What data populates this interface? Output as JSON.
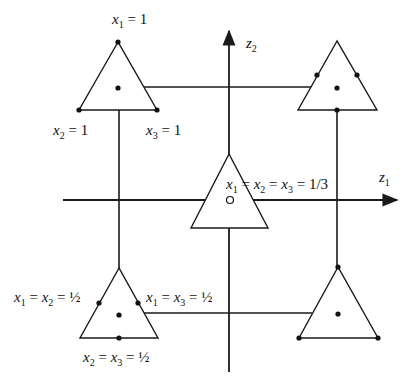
{
  "diagram": {
    "type": "simplex-embedding",
    "axes": {
      "horizontal": {
        "label": "z",
        "subscript": "1"
      },
      "vertical": {
        "label": "z",
        "subscript": "2"
      }
    },
    "triangles": [
      {
        "id": "top-left",
        "points": [
          "vertex top",
          "vertex bottom-left",
          "vertex bottom-right",
          "centroid"
        ],
        "labels": {
          "top": {
            "var": "x",
            "sub": "1",
            "rest": " = 1"
          },
          "bottom_left": {
            "var": "x",
            "sub": "2",
            "rest": " = 1"
          },
          "bottom_right": {
            "var": "x",
            "sub": "3",
            "rest": " = 1"
          }
        }
      },
      {
        "id": "top-right",
        "points": [
          "left-edge midpoint",
          "right-edge midpoint",
          "bottom-edge midpoint",
          "centroid"
        ]
      },
      {
        "id": "center",
        "points": [
          "centroid (open circle)"
        ],
        "label": {
          "text": "x1 = x2 = x3 = 1/3",
          "v1": "x",
          "s1": "1",
          "v2": "x",
          "s2": "2",
          "v3": "x",
          "s3": "3",
          "value": "1/3"
        }
      },
      {
        "id": "bottom-left",
        "points": [
          "left-edge midpoint",
          "right-edge midpoint",
          "bottom-edge midpoint",
          "centroid"
        ],
        "labels": {
          "left": {
            "text": "x1 = x2 = ½",
            "va": "x",
            "sa": "1",
            "vb": "x",
            "sb": "2",
            "value": "½"
          },
          "right": {
            "text": "x1 = x3 = ½",
            "va": "x",
            "sa": "1",
            "vb": "x",
            "sb": "3",
            "value": "½"
          },
          "bottom": {
            "text": "x2 = x3 = ½",
            "va": "x",
            "sa": "2",
            "vb": "x",
            "sb": "3",
            "value": "½"
          }
        }
      },
      {
        "id": "bottom-right",
        "points": [
          "vertex top",
          "vertex bottom-left",
          "vertex bottom-right",
          "centroid"
        ]
      }
    ],
    "eq": " = "
  }
}
